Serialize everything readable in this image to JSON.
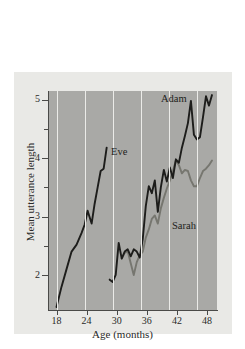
{
  "chart_data": {
    "type": "line",
    "title": "",
    "xlabel": "Age (months)",
    "ylabel": "Mean utterance length",
    "xlim": [
      16.5,
      50
    ],
    "ylim": [
      1.4,
      5.15
    ],
    "xticks": [
      18,
      24,
      30,
      36,
      42,
      48
    ],
    "yticks": [
      2,
      3,
      4,
      5
    ],
    "yticks_minor": [
      2.5,
      3.5,
      4.5
    ],
    "grid": "vertical",
    "legend_position": "inline-annotations",
    "plot_background": "#a9a9a6",
    "figure_background": "#e9e9e6",
    "gridline_color": "#ebebe8",
    "series": [
      {
        "name": "Eve",
        "color": "#1d1d1b",
        "label_x": 28.2,
        "label_y": 4.08,
        "x": [
          18.0,
          19.0,
          20.0,
          21.0,
          22.0,
          23.0,
          23.6,
          24.2,
          25.0,
          25.6,
          26.2,
          26.8,
          27.4,
          28.0
        ],
        "y": [
          1.45,
          1.8,
          2.1,
          2.4,
          2.52,
          2.72,
          2.86,
          3.1,
          2.88,
          3.22,
          3.5,
          3.78,
          3.82,
          4.18
        ]
      },
      {
        "name": "Adam",
        "color": "#1d1d1b",
        "label_x": 42.5,
        "label_y": 4.92,
        "x": [
          28.6,
          29.2,
          29.8,
          30.4,
          31.0,
          31.6,
          32.2,
          32.8,
          33.4,
          34.0,
          34.6,
          35.2,
          35.8,
          36.4,
          37.0,
          37.6,
          38.2,
          38.8,
          39.4,
          40.0,
          40.6,
          41.2,
          41.8,
          42.4,
          43.0,
          43.6,
          44.2,
          44.8,
          45.4,
          46.0,
          46.6,
          47.2,
          47.8,
          48.4,
          49.0
        ],
        "y": [
          1.92,
          1.88,
          2.0,
          2.55,
          2.28,
          2.4,
          2.44,
          2.32,
          2.44,
          2.4,
          2.3,
          2.62,
          3.18,
          3.52,
          3.4,
          3.62,
          3.08,
          3.5,
          3.8,
          3.6,
          3.84,
          3.66,
          3.98,
          3.92,
          4.18,
          4.38,
          4.6,
          4.98,
          4.4,
          4.32,
          4.36,
          4.7,
          5.06,
          4.9,
          5.08
        ]
      },
      {
        "name": "Sarah",
        "color": "#76766f",
        "label_x": 44.2,
        "label_y": 2.88,
        "x": [
          31.0,
          31.6,
          32.2,
          32.8,
          33.4,
          34.0,
          34.6,
          35.2,
          35.8,
          36.4,
          37.0,
          37.6,
          38.2,
          38.8,
          39.4,
          40.0,
          40.6,
          41.2,
          41.8,
          42.4,
          43.0,
          43.6,
          44.2,
          44.8,
          45.4,
          46.0,
          46.6,
          47.2,
          47.8,
          48.4,
          49.0
        ],
        "y": [
          2.28,
          2.38,
          2.4,
          2.2,
          2.0,
          2.22,
          2.34,
          2.4,
          2.64,
          2.78,
          2.96,
          3.02,
          2.88,
          3.14,
          3.32,
          3.48,
          3.62,
          3.78,
          3.96,
          3.88,
          3.74,
          3.8,
          3.78,
          3.62,
          3.52,
          3.52,
          3.66,
          3.78,
          3.82,
          3.88,
          3.96
        ]
      }
    ]
  },
  "axes": {
    "x_title": "Age (months)",
    "y_title": "Mean utterance length",
    "x_tick_labels": [
      "18",
      "24",
      "30",
      "36",
      "42",
      "48"
    ],
    "y_tick_labels": [
      "2",
      "3",
      "4",
      "5"
    ]
  },
  "annotations": {
    "eve": "Eve",
    "adam": "Adam",
    "sarah": "Sarah"
  }
}
